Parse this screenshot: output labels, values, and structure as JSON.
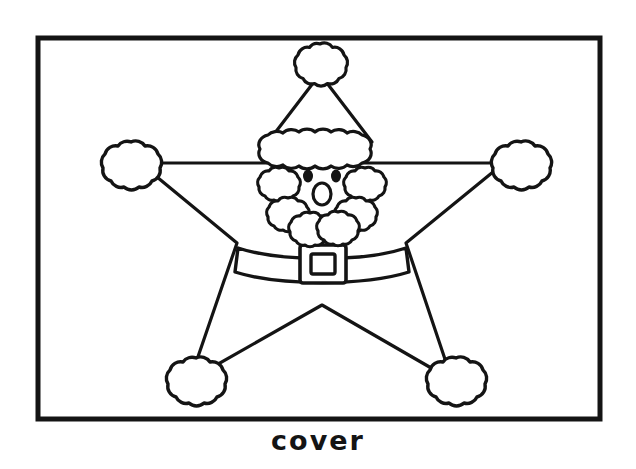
{
  "page": {
    "background_color": "#ffffff",
    "ink_color": "#141414",
    "width": 636,
    "height": 469
  },
  "caption": {
    "text": "cover",
    "align": "center"
  },
  "frame": {
    "name": "page-border",
    "x": 38,
    "y": 38,
    "width": 562,
    "height": 381,
    "stroke_width": 5,
    "stroke_color": "#141414",
    "fill": "none"
  },
  "figure": {
    "name": "santa-star",
    "stroke_color": "#141414",
    "fill": "#ffffff",
    "parts": [
      {
        "name": "star-body",
        "label": "Star body outline"
      },
      {
        "name": "hat-cone",
        "label": "Pointed hat"
      },
      {
        "name": "hat-pompom",
        "label": "Hat pom-pom"
      },
      {
        "name": "hat-brim",
        "label": "Fluffy hat brim"
      },
      {
        "name": "face",
        "label": "Face"
      },
      {
        "name": "left-eye",
        "label": "Left eye"
      },
      {
        "name": "right-eye",
        "label": "Right eye"
      },
      {
        "name": "nose",
        "label": "Nose"
      },
      {
        "name": "beard",
        "label": "Fluffy beard"
      },
      {
        "name": "belt",
        "label": "Belt band"
      },
      {
        "name": "belt-buckle",
        "label": "Belt buckle"
      },
      {
        "name": "left-mitten",
        "label": "Left mitten puff"
      },
      {
        "name": "right-mitten",
        "label": "Right mitten puff"
      },
      {
        "name": "left-boot",
        "label": "Left boot puff"
      },
      {
        "name": "right-boot",
        "label": "Right boot puff"
      }
    ]
  },
  "colors": {
    "ink": "#141414",
    "paper": "#ffffff"
  }
}
